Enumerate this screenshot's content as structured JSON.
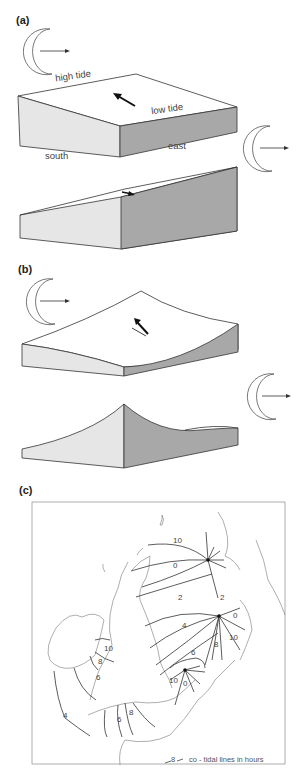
{
  "panels": {
    "a": {
      "label": "(a)",
      "labels": {
        "high_tide": "high tide",
        "low_tide": "low tide",
        "south": "south",
        "east": "east"
      }
    },
    "b": {
      "label": "(b)"
    },
    "c": {
      "label": "(c)",
      "legend": {
        "symbol_value": "8",
        "text": "co - tidal lines in hours"
      },
      "cotidal_labels": [
        "10",
        "0",
        "2",
        "2",
        "0",
        "4",
        "10",
        "8",
        "6",
        "10",
        "0",
        "10",
        "8",
        "6",
        "4",
        "6",
        "8"
      ]
    }
  },
  "icons": [
    "moon-crescent-icon",
    "arrow-right-icon",
    "tide-flow-arrow-icon",
    "amphidromic-point-icon"
  ],
  "colors": {
    "face_light": "#e6e6e6",
    "face_dark": "#a8a8a8",
    "top": "#ffffff",
    "line": "#333333"
  }
}
